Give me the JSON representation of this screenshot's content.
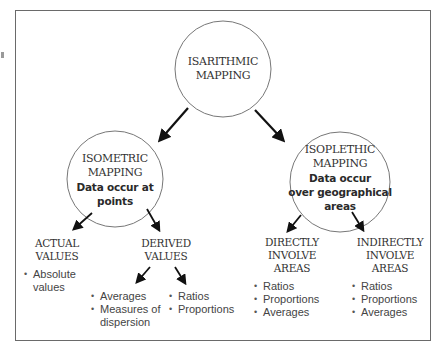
{
  "diagram": {
    "root": {
      "title_line1": "ISARITHMIC",
      "title_line2": "MAPPING"
    },
    "isometric": {
      "title_line1": "ISOMETRIC",
      "title_line2": "MAPPING",
      "desc_line1": "Data occur at",
      "desc_line2": "points"
    },
    "isoplethic": {
      "title_line1": "ISOPLETHIC",
      "title_line2": "MAPPING",
      "desc_line1": "Data occur",
      "desc_line2": "over geographical",
      "desc_line3": "areas"
    },
    "actual_values": {
      "title_line1": "ACTUAL",
      "title_line2": "VALUES",
      "items": [
        "Absolute values"
      ]
    },
    "derived_values": {
      "title_line1": "DERIVED",
      "title_line2": "VALUES",
      "left_items": [
        "Averages",
        "Measures of dispersion"
      ],
      "right_items": [
        "Ratios",
        "Proportions"
      ]
    },
    "directly": {
      "title_line1": "DIRECTLY",
      "title_line2": "INVOLVE",
      "title_line3": "AREAS",
      "items": [
        "Ratios",
        "Proportions",
        "Averages"
      ]
    },
    "indirectly": {
      "title_line1": "INDIRECTLY",
      "title_line2": "INVOLVE",
      "title_line3": "AREAS",
      "items": [
        "Ratios",
        "Proportions",
        "Averages"
      ]
    }
  }
}
